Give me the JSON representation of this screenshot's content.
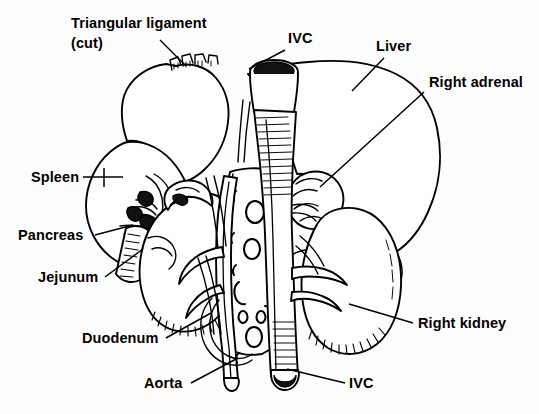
{
  "figure": {
    "width": 539,
    "height": 414,
    "background_color": "#fdfdfd",
    "ink_color": "#000000",
    "style": "black-and-white ink line drawing with hatched shading"
  },
  "labels": [
    {
      "id": "triangular-ligament",
      "line1": "Triangular ligament",
      "line2": "(cut)",
      "x": 71,
      "y": 28,
      "y2": 48,
      "leader": "M 160 40 L 186 66"
    },
    {
      "id": "ivc-top",
      "line1": "IVC",
      "line2": "",
      "x": 288,
      "y": 43,
      "y2": 0,
      "leader": "M 285 50 L 249 69"
    },
    {
      "id": "liver",
      "line1": "Liver",
      "line2": "",
      "x": 376,
      "y": 51,
      "y2": 0,
      "leader": "M 384 58 L 352 91"
    },
    {
      "id": "right-adrenal",
      "line1": "Right adrenal",
      "line2": "",
      "x": 429,
      "y": 87,
      "y2": 0,
      "leader": "M 424 92 L 320 187"
    },
    {
      "id": "spleen",
      "line1": "Spleen",
      "line2": "",
      "x": 31,
      "y": 182,
      "y2": 0,
      "leader": "M 83 177 L 123 177"
    },
    {
      "id": "pancreas",
      "line1": "Pancreas",
      "line2": "",
      "x": 18,
      "y": 240,
      "y2": 0,
      "leader": "M 95 235 L 133 225"
    },
    {
      "id": "jejunum",
      "line1": "Jejunum",
      "line2": "",
      "x": 38,
      "y": 282,
      "y2": 0,
      "leader": "M 105 277 L 143 249"
    },
    {
      "id": "duodenum",
      "line1": "Duodenum",
      "line2": "",
      "x": 82,
      "y": 343,
      "y2": 0,
      "leader": "M 166 338 L 211 313"
    },
    {
      "id": "aorta",
      "line1": "Aorta",
      "line2": "",
      "x": 144,
      "y": 388,
      "y2": 0,
      "leader": "M 191 383 L 238 358"
    },
    {
      "id": "ivc-bottom",
      "line1": "IVC",
      "line2": "",
      "x": 349,
      "y": 388,
      "y2": 0,
      "leader": "M 345 383 L 287 369"
    },
    {
      "id": "right-kidney",
      "line1": "Right kidney",
      "line2": "",
      "x": 418,
      "y": 328,
      "y2": 0,
      "leader": "M 413 323 L 349 304"
    }
  ]
}
